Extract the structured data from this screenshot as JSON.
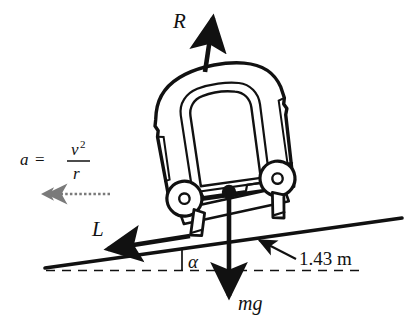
{
  "figure": {
    "background_color": "#ffffff",
    "stroke_color": "#111111",
    "accel_color": "#7a7a7a"
  },
  "labels": {
    "normal_force": "R",
    "lateral_force": "L",
    "weight": "mg",
    "bank_angle": "α",
    "track_gauge": "1.43 m",
    "accel_lhs": "a",
    "accel_equals": "=",
    "accel_numerator": "v",
    "accel_numerator_exponent": "2",
    "accel_denominator": "r"
  },
  "vectors": [
    {
      "name": "normal-force",
      "label": "R",
      "direction": "up-right",
      "origin": "vehicle roof",
      "color": "#111111"
    },
    {
      "name": "lateral-force",
      "label": "L",
      "direction": "left-down along track",
      "origin": "wheel/rail contact",
      "color": "#111111"
    },
    {
      "name": "weight-force",
      "label": "mg",
      "direction": "down",
      "origin": "centre of mass",
      "color": "#111111"
    },
    {
      "name": "centripetal-acceleration",
      "label": "a = v^2 / r",
      "direction": "left",
      "origin": "left of vehicle",
      "color": "#7a7a7a"
    }
  ],
  "annotations": {
    "gauge_callout": "1.43 m",
    "angle_callout": "α",
    "horizontal_reference": "dashed horizontal datum line",
    "track_line": "inclined rail line"
  }
}
